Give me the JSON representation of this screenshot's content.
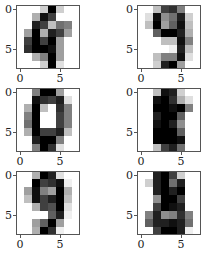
{
  "chart_data": [
    {
      "type": "heatmap",
      "title": "",
      "label": "digit 4",
      "colormap": "gray_r",
      "vmin": 0,
      "vmax": 16,
      "xticks": [
        "0",
        "5"
      ],
      "yticks": [
        "0",
        "5"
      ],
      "values": [
        [
          0,
          0,
          0,
          3,
          16,
          3,
          0,
          0
        ],
        [
          0,
          0,
          5,
          15,
          12,
          0,
          0,
          0
        ],
        [
          0,
          0,
          14,
          12,
          4,
          9,
          8,
          0
        ],
        [
          0,
          6,
          16,
          5,
          14,
          12,
          6,
          0
        ],
        [
          0,
          12,
          16,
          12,
          16,
          6,
          0,
          0
        ],
        [
          0,
          13,
          16,
          16,
          15,
          6,
          0,
          0
        ],
        [
          0,
          0,
          5,
          8,
          16,
          6,
          0,
          0
        ],
        [
          0,
          0,
          0,
          3,
          16,
          2,
          0,
          0
        ]
      ]
    },
    {
      "type": "heatmap",
      "title": "",
      "label": "digit 9",
      "colormap": "gray_r",
      "vmin": 0,
      "vmax": 16,
      "xticks": [
        "0",
        "5"
      ],
      "yticks": [
        "0",
        "5"
      ],
      "values": [
        [
          0,
          0,
          4,
          12,
          13,
          8,
          0,
          0
        ],
        [
          0,
          2,
          15,
          7,
          9,
          14,
          3,
          0
        ],
        [
          0,
          4,
          16,
          6,
          10,
          15,
          4,
          0
        ],
        [
          0,
          0,
          10,
          16,
          16,
          14,
          5,
          0
        ],
        [
          0,
          0,
          0,
          4,
          4,
          15,
          8,
          0
        ],
        [
          0,
          0,
          0,
          0,
          1,
          14,
          4,
          0
        ],
        [
          0,
          0,
          4,
          8,
          8,
          15,
          2,
          0
        ],
        [
          0,
          0,
          3,
          14,
          16,
          6,
          0,
          0
        ]
      ]
    },
    {
      "type": "heatmap",
      "title": "",
      "label": "digit 0",
      "colormap": "gray_r",
      "vmin": 0,
      "vmax": 16,
      "xticks": [
        "0",
        "5"
      ],
      "yticks": [
        "0",
        "5"
      ],
      "values": [
        [
          0,
          0,
          8,
          16,
          16,
          6,
          0,
          0
        ],
        [
          0,
          0,
          15,
          13,
          12,
          14,
          2,
          0
        ],
        [
          0,
          5,
          16,
          4,
          0,
          13,
          8,
          0
        ],
        [
          0,
          8,
          16,
          0,
          0,
          12,
          8,
          0
        ],
        [
          0,
          9,
          16,
          0,
          0,
          12,
          8,
          0
        ],
        [
          0,
          5,
          16,
          12,
          12,
          14,
          4,
          0
        ],
        [
          0,
          0,
          14,
          16,
          16,
          8,
          0,
          0
        ],
        [
          0,
          0,
          8,
          16,
          13,
          2,
          0,
          0
        ]
      ]
    },
    {
      "type": "heatmap",
      "title": "",
      "label": "digit 8",
      "colormap": "gray_r",
      "vmin": 0,
      "vmax": 16,
      "xticks": [
        "0",
        "5"
      ],
      "yticks": [
        "0",
        "5"
      ],
      "values": [
        [
          0,
          0,
          4,
          15,
          14,
          3,
          0,
          0
        ],
        [
          0,
          0,
          15,
          16,
          13,
          5,
          2,
          0
        ],
        [
          0,
          0,
          16,
          16,
          15,
          16,
          8,
          0
        ],
        [
          0,
          0,
          14,
          16,
          16,
          10,
          0,
          0
        ],
        [
          0,
          0,
          15,
          16,
          14,
          7,
          0,
          0
        ],
        [
          0,
          0,
          16,
          16,
          16,
          10,
          0,
          0
        ],
        [
          0,
          0,
          16,
          16,
          16,
          15,
          0,
          0
        ],
        [
          0,
          0,
          4,
          12,
          14,
          9,
          0,
          0
        ]
      ]
    },
    {
      "type": "heatmap",
      "title": "",
      "label": "digit 9",
      "colormap": "gray_r",
      "vmin": 0,
      "vmax": 16,
      "xticks": [
        "0",
        "5"
      ],
      "yticks": [
        "0",
        "5"
      ],
      "values": [
        [
          0,
          0,
          5,
          16,
          14,
          2,
          0,
          0
        ],
        [
          0,
          0,
          16,
          12,
          13,
          15,
          1,
          0
        ],
        [
          0,
          6,
          15,
          8,
          6,
          16,
          5,
          0
        ],
        [
          0,
          4,
          15,
          12,
          14,
          16,
          4,
          0
        ],
        [
          0,
          0,
          5,
          12,
          11,
          16,
          2,
          0
        ],
        [
          0,
          0,
          0,
          0,
          10,
          14,
          1,
          0
        ],
        [
          0,
          0,
          6,
          10,
          16,
          6,
          0,
          0
        ],
        [
          0,
          0,
          5,
          16,
          13,
          1,
          0,
          0
        ]
      ]
    },
    {
      "type": "heatmap",
      "title": "",
      "label": "digit 8",
      "colormap": "gray_r",
      "vmin": 0,
      "vmax": 16,
      "xticks": [
        "0",
        "5"
      ],
      "yticks": [
        "0",
        "5"
      ],
      "values": [
        [
          0,
          0,
          14,
          16,
          12,
          3,
          0,
          0
        ],
        [
          0,
          3,
          14,
          16,
          9,
          14,
          0,
          0
        ],
        [
          0,
          0,
          14,
          16,
          14,
          16,
          0,
          0
        ],
        [
          0,
          0,
          7,
          16,
          16,
          12,
          0,
          0
        ],
        [
          0,
          0,
          12,
          16,
          15,
          14,
          0,
          0
        ],
        [
          0,
          8,
          14,
          7,
          8,
          13,
          8,
          0
        ],
        [
          0,
          10,
          14,
          14,
          15,
          14,
          9,
          0
        ],
        [
          0,
          0,
          12,
          16,
          16,
          14,
          1,
          0
        ]
      ]
    }
  ],
  "layout": {
    "rows": 3,
    "cols": 2,
    "panel_positions": [
      {
        "left": 16,
        "top": 5
      },
      {
        "left": 137,
        "top": 5
      },
      {
        "left": 16,
        "top": 88
      },
      {
        "left": 137,
        "top": 88
      },
      {
        "left": 16,
        "top": 171
      },
      {
        "left": 137,
        "top": 171
      }
    ]
  }
}
